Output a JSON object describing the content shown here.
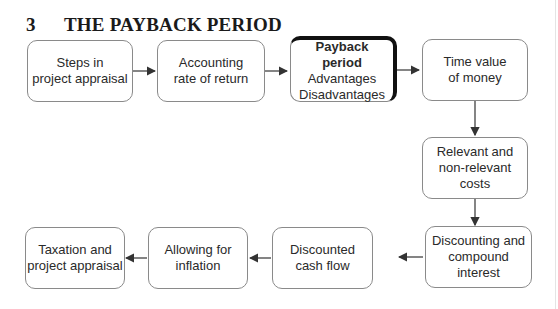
{
  "title": {
    "number": "3",
    "text": "THE PAYBACK PERIOD"
  },
  "boxes": {
    "steps": {
      "line1": "Steps in",
      "line2": "project appraisal"
    },
    "arr": {
      "line1": "Accounting",
      "line2": "rate of return"
    },
    "payback": {
      "line1": "Payback",
      "line2": "period",
      "line3": "Advantages",
      "line4": "Disadvantages"
    },
    "tvm": {
      "line1": "Time value",
      "line2": "of money"
    },
    "relevant": {
      "line1": "Relevant and",
      "line2": "non-relevant costs"
    },
    "discounting": {
      "line1": "Discounting and",
      "line2": "compound interest"
    },
    "dcf": {
      "line1": "Discounted",
      "line2": "cash flow"
    },
    "inflation": {
      "line1": "Allowing for",
      "line2": "inflation"
    },
    "taxation": {
      "line1": "Taxation and",
      "line2": "project appraisal"
    }
  },
  "colors": {
    "border": "#8a8a8a",
    "arrow": "#333333",
    "highlight": "#111111"
  }
}
